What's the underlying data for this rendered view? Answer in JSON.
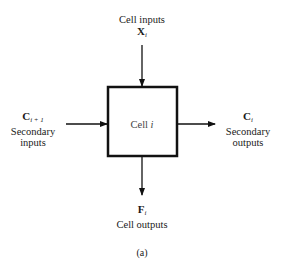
{
  "diagram": {
    "caption": "(a)",
    "cell": {
      "label": "Cell",
      "index": "i"
    },
    "top_input": {
      "label": "Cell inputs",
      "symbol": "X",
      "subscript": "i"
    },
    "left_input": {
      "symbol": "C",
      "subscript": "i + 1",
      "line1": "Secondary",
      "line2": "inputs"
    },
    "right_output": {
      "symbol": "C",
      "subscript": "i",
      "line1": "Secondary",
      "line2": "outputs"
    },
    "bottom_output": {
      "symbol": "F",
      "subscript": "i",
      "label": "Cell outputs"
    },
    "colors": {
      "stroke": "#111111",
      "text": "#1a1a1a",
      "background": "#ffffff"
    }
  }
}
